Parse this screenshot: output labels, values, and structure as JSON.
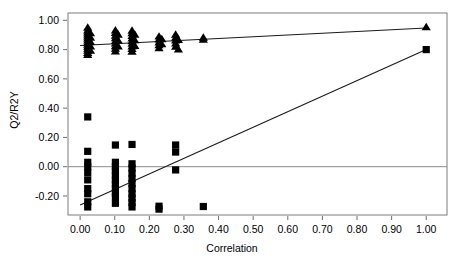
{
  "chart_data": {
    "type": "scatter",
    "title": "",
    "xlabel": "Correlation",
    "ylabel": "Q2/R2Y",
    "xlim": [
      -0.035,
      1.06
    ],
    "ylim": [
      -0.33,
      1.05
    ],
    "grid": false,
    "legend": null,
    "xticks": [
      0.0,
      0.1,
      0.2,
      0.3,
      0.4,
      0.5,
      0.6,
      0.7,
      0.8,
      0.9,
      1.0
    ],
    "xtick_labels": [
      "0.00",
      "0.10",
      "0.20",
      "0.30",
      "0.40",
      "0.50",
      "0.60",
      "0.70",
      "0.80",
      "0.90",
      "1.00"
    ],
    "yticks": [
      -0.2,
      0.0,
      0.2,
      0.4,
      0.6,
      0.8,
      1.0
    ],
    "ytick_labels": [
      "-0.20",
      "0.00",
      "0.20",
      "0.40",
      "0.60",
      "0.80",
      "1.00"
    ],
    "reference_lines": [
      {
        "name": "zero-line",
        "orientation": "horizontal",
        "y": 0.0,
        "color": "#8a8a8a"
      }
    ],
    "series": [
      {
        "name": "R2Y",
        "marker": "triangle",
        "color": "#000000",
        "points": [
          [
            0.022,
            0.948
          ],
          [
            0.022,
            0.93
          ],
          [
            0.022,
            0.916
          ],
          [
            0.022,
            0.902
          ],
          [
            0.022,
            0.888
          ],
          [
            0.022,
            0.874
          ],
          [
            0.022,
            0.86
          ],
          [
            0.022,
            0.846
          ],
          [
            0.022,
            0.832
          ],
          [
            0.022,
            0.818
          ],
          [
            0.022,
            0.804
          ],
          [
            0.022,
            0.79
          ],
          [
            0.022,
            0.776
          ],
          [
            0.022,
            0.762
          ],
          [
            0.03,
            0.91
          ],
          [
            0.03,
            0.88
          ],
          [
            0.03,
            0.85
          ],
          [
            0.03,
            0.82
          ],
          [
            0.03,
            0.79
          ],
          [
            0.102,
            0.93
          ],
          [
            0.102,
            0.912
          ],
          [
            0.102,
            0.894
          ],
          [
            0.102,
            0.876
          ],
          [
            0.102,
            0.858
          ],
          [
            0.102,
            0.84
          ],
          [
            0.102,
            0.822
          ],
          [
            0.102,
            0.804
          ],
          [
            0.102,
            0.786
          ],
          [
            0.11,
            0.9
          ],
          [
            0.11,
            0.86
          ],
          [
            0.11,
            0.82
          ],
          [
            0.15,
            0.928
          ],
          [
            0.15,
            0.91
          ],
          [
            0.15,
            0.892
          ],
          [
            0.15,
            0.874
          ],
          [
            0.15,
            0.856
          ],
          [
            0.15,
            0.838
          ],
          [
            0.15,
            0.82
          ],
          [
            0.15,
            0.802
          ],
          [
            0.15,
            0.784
          ],
          [
            0.158,
            0.9
          ],
          [
            0.158,
            0.862
          ],
          [
            0.158,
            0.824
          ],
          [
            0.228,
            0.888
          ],
          [
            0.228,
            0.868
          ],
          [
            0.228,
            0.848
          ],
          [
            0.228,
            0.828
          ],
          [
            0.228,
            0.808
          ],
          [
            0.236,
            0.87
          ],
          [
            0.236,
            0.835
          ],
          [
            0.276,
            0.9
          ],
          [
            0.276,
            0.88
          ],
          [
            0.276,
            0.86
          ],
          [
            0.276,
            0.84
          ],
          [
            0.276,
            0.818
          ],
          [
            0.284,
            0.865
          ],
          [
            0.284,
            0.8
          ],
          [
            0.356,
            0.88
          ],
          [
            0.356,
            0.866
          ],
          [
            1.0,
            0.952
          ]
        ]
      },
      {
        "name": "Q2",
        "marker": "square",
        "color": "#000000",
        "points": [
          [
            0.022,
            0.34
          ],
          [
            0.022,
            0.105
          ],
          [
            0.022,
            0.03
          ],
          [
            0.022,
            0.0
          ],
          [
            0.022,
            -0.04
          ],
          [
            0.022,
            -0.09
          ],
          [
            0.022,
            -0.15
          ],
          [
            0.022,
            -0.185
          ],
          [
            0.022,
            -0.24
          ],
          [
            0.022,
            -0.275
          ],
          [
            0.102,
            0.148
          ],
          [
            0.102,
            0.03
          ],
          [
            0.102,
            0.0
          ],
          [
            0.102,
            -0.03
          ],
          [
            0.102,
            -0.06
          ],
          [
            0.102,
            -0.09
          ],
          [
            0.102,
            -0.12
          ],
          [
            0.102,
            -0.15
          ],
          [
            0.102,
            -0.18
          ],
          [
            0.102,
            -0.205
          ],
          [
            0.102,
            -0.25
          ],
          [
            0.15,
            0.152
          ],
          [
            0.15,
            0.02
          ],
          [
            0.15,
            -0.01
          ],
          [
            0.15,
            -0.045
          ],
          [
            0.15,
            -0.08
          ],
          [
            0.15,
            -0.115
          ],
          [
            0.15,
            -0.15
          ],
          [
            0.15,
            -0.185
          ],
          [
            0.15,
            -0.215
          ],
          [
            0.15,
            -0.245
          ],
          [
            0.15,
            -0.275
          ],
          [
            0.228,
            -0.27
          ],
          [
            0.228,
            -0.29
          ],
          [
            0.276,
            0.148
          ],
          [
            0.276,
            0.1
          ],
          [
            0.276,
            -0.022
          ],
          [
            0.356,
            -0.272
          ],
          [
            1.0,
            0.8
          ]
        ]
      }
    ],
    "fit_lines": [
      {
        "name": "r2y-fit-line",
        "x0": 0.0,
        "y0": 0.828,
        "x1": 1.0,
        "y1": 0.948,
        "color": "#1a1a1a"
      },
      {
        "name": "q2-fit-line",
        "x0": 0.0,
        "y0": -0.262,
        "x1": 1.0,
        "y1": 0.8,
        "color": "#1a1a1a"
      }
    ]
  }
}
